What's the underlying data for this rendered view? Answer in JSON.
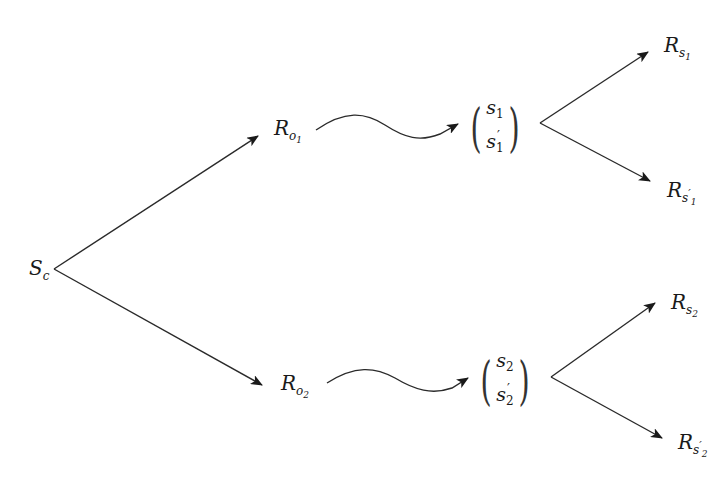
{
  "diagram": {
    "type": "branching-tree",
    "root": {
      "id": "S_c",
      "base": "S",
      "sub": "c"
    },
    "level1": [
      {
        "id": "R_o1",
        "base": "R",
        "sub": "o",
        "subsub": "1"
      },
      {
        "id": "R_o2",
        "base": "R",
        "sub": "o",
        "subsub": "2"
      }
    ],
    "vectors": [
      {
        "id": "vec1",
        "top": {
          "base": "s",
          "sub": "1"
        },
        "bottom": {
          "base": "s",
          "prime": "′",
          "sub": "1"
        }
      },
      {
        "id": "vec2",
        "top": {
          "base": "s",
          "sub": "2"
        },
        "bottom": {
          "base": "s",
          "prime": "′",
          "sub": "2"
        }
      }
    ],
    "leaves": [
      {
        "id": "R_s1",
        "base": "R",
        "sub": "s",
        "subsub": "1",
        "prime": ""
      },
      {
        "id": "R_s1p",
        "base": "R",
        "sub": "s",
        "subsub": "1",
        "prime": "′"
      },
      {
        "id": "R_s2",
        "base": "R",
        "sub": "s",
        "subsub": "2",
        "prime": ""
      },
      {
        "id": "R_s2p",
        "base": "R",
        "sub": "s",
        "subsub": "2",
        "prime": "′"
      }
    ],
    "edges": [
      {
        "from": "S_c",
        "to": "R_o1",
        "style": "straight-arrow"
      },
      {
        "from": "S_c",
        "to": "R_o2",
        "style": "straight-arrow"
      },
      {
        "from": "R_o1",
        "to": "vec1",
        "style": "wavy-arrow"
      },
      {
        "from": "R_o2",
        "to": "vec2",
        "style": "wavy-arrow"
      },
      {
        "from": "vec1",
        "to": "R_s1",
        "style": "straight-arrow"
      },
      {
        "from": "vec1",
        "to": "R_s1p",
        "style": "straight-arrow"
      },
      {
        "from": "vec2",
        "to": "R_s2",
        "style": "straight-arrow"
      },
      {
        "from": "vec2",
        "to": "R_s2p",
        "style": "straight-arrow"
      }
    ],
    "colors": {
      "stroke": "#2a2a2a",
      "background": "#ffffff"
    }
  }
}
